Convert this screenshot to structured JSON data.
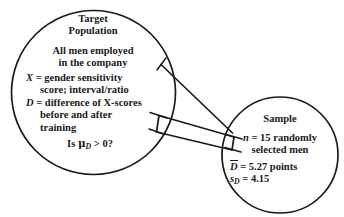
{
  "diagram": {
    "stroke_color": "#1a1a1a",
    "background_color": "#ffffff"
  },
  "target_population": {
    "heading_line1": "Target",
    "heading_line2": "Population",
    "desc_line1": "All men employed",
    "desc_line2": "in the company",
    "var_x_symbol": "X",
    "var_x_line1": "= gender sensitivity",
    "var_x_line2": "score; interval/ratio",
    "var_d_symbol": "D",
    "var_d_line1": "= difference of X-scores",
    "var_d_line2": "before and after",
    "var_d_line3": "training",
    "question_prefix": "Is",
    "question_mu": "μ",
    "question_sub": "D",
    "question_suffix": "> 0?"
  },
  "sample": {
    "heading": "Sample",
    "n_line1_symbol": "n",
    "n_line1_text": "= 15 randomly",
    "n_line2_text": "selected men",
    "dbar_symbol": "D",
    "dbar_text": "= 5.27 points",
    "sd_symbol": "s",
    "sd_sub": "D",
    "sd_text": "= 4.15"
  }
}
